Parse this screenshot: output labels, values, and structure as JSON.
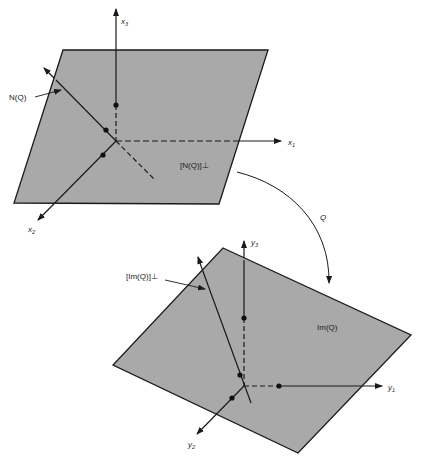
{
  "colors": {
    "plane_fill": "#a9a9a9",
    "line": "#1a1a1a",
    "background": "#ffffff"
  },
  "domain_space": {
    "plane_label": "[N(Q)]⊥",
    "line_label": "N(Q)",
    "axes": [
      {
        "name": "x",
        "sub": "1"
      },
      {
        "name": "x",
        "sub": "2"
      },
      {
        "name": "x",
        "sub": "3"
      }
    ]
  },
  "codomain_space": {
    "plane_label": "Im(Q)",
    "line_label": "[Im(Q)]⊥",
    "axes": [
      {
        "name": "y",
        "sub": "1"
      },
      {
        "name": "y",
        "sub": "2"
      },
      {
        "name": "y",
        "sub": "3"
      }
    ]
  },
  "mapping": {
    "label": "Q"
  }
}
